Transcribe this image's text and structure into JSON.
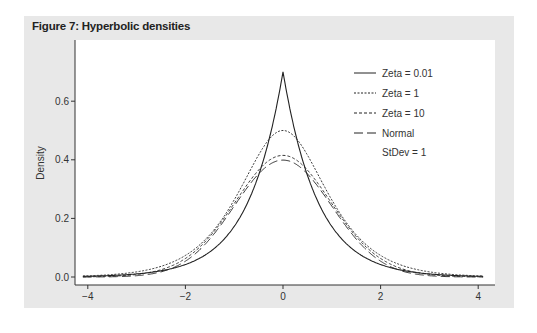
{
  "figure": {
    "title": "Figure 7: Hyperbolic densities"
  },
  "chart_data": {
    "type": "line",
    "title": "Figure 7: Hyperbolic densities",
    "xlabel": "",
    "ylabel": "Density",
    "xlim": [
      -4.2,
      4.2
    ],
    "ylim": [
      -0.02,
      0.75
    ],
    "xticks": [
      -4,
      -2,
      0,
      2,
      4
    ],
    "yticks": [
      0.0,
      0.2,
      0.4,
      0.6
    ],
    "ytick_labels": [
      "0.0",
      "0.2",
      "0.4",
      "0.6"
    ],
    "grid": false,
    "legend_position": "upper right",
    "annotation": "StDev = 1",
    "x": [
      -4,
      -3.5,
      -3,
      -2.5,
      -2,
      -1.5,
      -1,
      -0.5,
      -0.25,
      0,
      0.25,
      0.5,
      1,
      1.5,
      2,
      2.5,
      3,
      3.5,
      4
    ],
    "series": [
      {
        "name": "Zeta = 0.01",
        "style": "solid",
        "values": [
          0.002,
          0.005,
          0.01,
          0.02,
          0.042,
          0.086,
          0.172,
          0.345,
          0.49,
          0.7,
          0.49,
          0.345,
          0.172,
          0.086,
          0.042,
          0.02,
          0.01,
          0.005,
          0.002
        ]
      },
      {
        "name": "Zeta = 1",
        "style": "dotted",
        "values": [
          0.001,
          0.003,
          0.008,
          0.02,
          0.047,
          0.1,
          0.2,
          0.36,
          0.445,
          0.5,
          0.445,
          0.36,
          0.2,
          0.1,
          0.047,
          0.02,
          0.008,
          0.003,
          0.001
        ]
      },
      {
        "name": "Zeta = 10",
        "style": "short-dash",
        "values": [
          0.0,
          0.002,
          0.006,
          0.018,
          0.05,
          0.12,
          0.24,
          0.365,
          0.4,
          0.415,
          0.4,
          0.365,
          0.24,
          0.12,
          0.05,
          0.018,
          0.006,
          0.002,
          0.0
        ]
      },
      {
        "name": "Normal",
        "style": "long-dash",
        "values": [
          0.0,
          0.001,
          0.004,
          0.018,
          0.054,
          0.13,
          0.242,
          0.352,
          0.387,
          0.399,
          0.387,
          0.352,
          0.242,
          0.13,
          0.054,
          0.018,
          0.004,
          0.001,
          0.0
        ]
      }
    ]
  },
  "legend": {
    "items": [
      {
        "label": "Zeta = 0.01",
        "dash": ""
      },
      {
        "label": "Zeta = 1",
        "dash": "2,1.5"
      },
      {
        "label": "Zeta = 10",
        "dash": "3,2"
      },
      {
        "label": "Normal",
        "dash": "9,4"
      }
    ],
    "note": "StDev = 1"
  }
}
